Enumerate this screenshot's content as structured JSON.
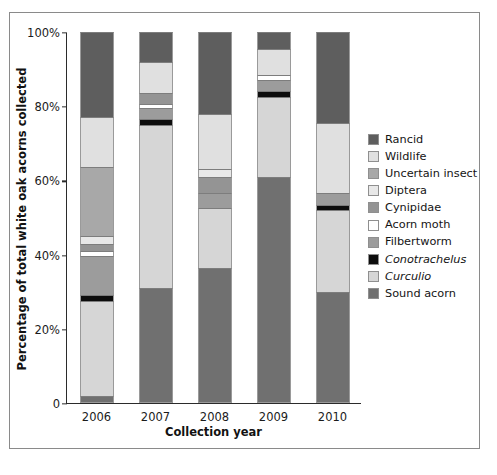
{
  "chart_data": {
    "type": "bar",
    "subtype": "stacked-100-percent",
    "title": "",
    "xlabel": "Collection year",
    "ylabel": "Percentage of total white oak acorns collected",
    "categories": [
      "2006",
      "2007",
      "2008",
      "2009",
      "2010"
    ],
    "ylim": [
      0,
      100
    ],
    "ytick_labels": [
      "0",
      "20%",
      "40%",
      "60%",
      "80%",
      "100%"
    ],
    "ytick_values": [
      0,
      20,
      40,
      60,
      80,
      100
    ],
    "grid": false,
    "legend_position": "right",
    "series": [
      {
        "name": "Sound acorn",
        "color": "#707070",
        "values": [
          2.0,
          31.0,
          36.5,
          61.0,
          30.0
        ]
      },
      {
        "name": "Curculio",
        "color": "#d6d6d6",
        "values": [
          25.5,
          44.0,
          16.0,
          21.5,
          22.0
        ]
      },
      {
        "name": "Conotrachelus",
        "color": "#0d0d0d",
        "values": [
          1.5,
          1.5,
          0.0,
          1.5,
          1.5
        ]
      },
      {
        "name": "Filbertworm",
        "color": "#9c9c9c",
        "values": [
          10.5,
          3.0,
          4.0,
          3.0,
          3.0
        ]
      },
      {
        "name": "Acorn moth",
        "color": "#ffffff",
        "values": [
          1.5,
          1.0,
          0.0,
          1.5,
          0.0
        ]
      },
      {
        "name": "Cynipidae",
        "color": "#949494",
        "values": [
          2.0,
          3.0,
          4.5,
          0.0,
          0.0
        ]
      },
      {
        "name": "Diptera",
        "color": "#e8e8e8",
        "values": [
          2.0,
          0.0,
          2.0,
          0.0,
          0.0
        ]
      },
      {
        "name": "Uncertain insect",
        "color": "#a8a8a8",
        "values": [
          18.5,
          0.0,
          0.0,
          0.0,
          0.0
        ]
      },
      {
        "name": "Wildlife",
        "color": "#e0e0e0",
        "values": [
          13.5,
          8.5,
          15.0,
          7.0,
          19.0
        ]
      },
      {
        "name": "Rancid",
        "color": "#5e5e5e",
        "values": [
          23.0,
          8.0,
          22.0,
          4.5,
          24.5
        ]
      }
    ],
    "legend_order": [
      "Rancid",
      "Wildlife",
      "Uncertain insect",
      "Diptera",
      "Cynipidae",
      "Acorn moth",
      "Filbertworm",
      "Conotrachelus",
      "Curculio",
      "Sound acorn"
    ],
    "italic_legend_entries": [
      "Conotrachelus",
      "Curculio"
    ]
  },
  "legend": {
    "items": [
      {
        "label": "Rancid",
        "color": "#5e5e5e",
        "italic": false
      },
      {
        "label": "Wildlife",
        "color": "#e0e0e0",
        "italic": false
      },
      {
        "label": "Uncertain insect",
        "color": "#a8a8a8",
        "italic": false
      },
      {
        "label": "Diptera",
        "color": "#e8e8e8",
        "italic": false
      },
      {
        "label": "Cynipidae",
        "color": "#949494",
        "italic": false
      },
      {
        "label": "Acorn moth",
        "color": "#ffffff",
        "italic": false
      },
      {
        "label": "Filbertworm",
        "color": "#9c9c9c",
        "italic": false
      },
      {
        "label": "Conotrachelus",
        "color": "#0d0d0d",
        "italic": true
      },
      {
        "label": "Curculio",
        "color": "#d6d6d6",
        "italic": true
      },
      {
        "label": "Sound acorn",
        "color": "#707070",
        "italic": false
      }
    ]
  },
  "axes": {
    "y_title": "Percentage of total white oak acorns collected",
    "x_title": "Collection year",
    "y_ticks": [
      "100%",
      "80%",
      "60%",
      "40%",
      "20%",
      "0"
    ],
    "x_ticks": [
      "2006",
      "2007",
      "2008",
      "2009",
      "2010"
    ]
  }
}
